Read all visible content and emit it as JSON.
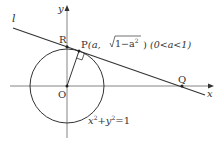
{
  "diagram": {
    "labels": {
      "line_l": "l",
      "axis_y": "y",
      "axis_x": "x",
      "origin": "O",
      "point_r": "R",
      "point_q": "Q",
      "point_p": "P",
      "point_p_coords_open": "(a, ",
      "point_p_sqrt": "1−a",
      "point_p_sqrt_exp": "2",
      "point_p_coords_close": ")",
      "condition": "(0<a<1)",
      "circle_eq_x": "x",
      "circle_eq_x_exp": "2",
      "circle_eq_plus": "+",
      "circle_eq_y": "y",
      "circle_eq_y_exp": "2",
      "circle_eq_rhs": "=1"
    },
    "colors": {
      "stroke": "#333333",
      "axis": "#555555",
      "background": "#ffffff"
    }
  }
}
